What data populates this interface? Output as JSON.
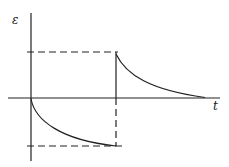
{
  "diagram": {
    "y_axis_label": "ε",
    "x_axis_label": "t",
    "line_color": "#222222",
    "background": "#ffffff"
  }
}
